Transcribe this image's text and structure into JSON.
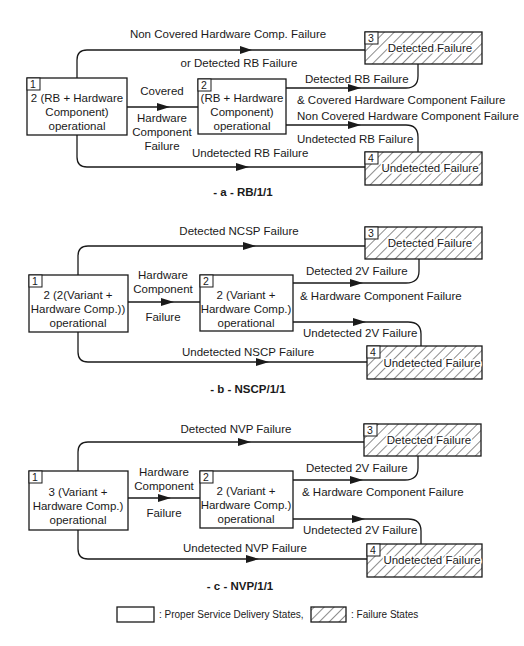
{
  "diagrams": [
    {
      "caption": "- a -  RB/1/1",
      "states": {
        "s1": {
          "num": "1",
          "lines": [
            "2 (RB + Hardware",
            "Component)",
            "operational"
          ]
        },
        "s2": {
          "num": "2",
          "lines": [
            "(RB + Hardware",
            "Component)",
            "operational"
          ]
        },
        "s3": {
          "num": "3",
          "label": "Detected Failure"
        },
        "s4": {
          "num": "4",
          "label": "Undetected Failure"
        }
      },
      "transitions": {
        "s1_s3": [
          "Non Covered Hardware Comp. Failure",
          "or Detected RB Failure"
        ],
        "s1_s2": [
          "Covered",
          "Hardware",
          "Component",
          "Failure"
        ],
        "s2_s3": [
          "Detected RB Failure",
          "& Covered Hardware Component Failure"
        ],
        "s2_s4": [
          "Non Covered Hardware Component Failure",
          "Undetected RB Failure"
        ],
        "s1_s4": [
          "Undetected RB Failure"
        ]
      }
    },
    {
      "caption": "- b -  NSCP/1/1",
      "states": {
        "s1": {
          "num": "1",
          "lines": [
            "2 (2(Variant +",
            "Hardware Comp.))",
            "operational"
          ]
        },
        "s2": {
          "num": "2",
          "lines": [
            "2 (Variant +",
            "Hardware Comp.)",
            "operational"
          ]
        },
        "s3": {
          "num": "3",
          "label": "Detected Failure"
        },
        "s4": {
          "num": "4",
          "label": "Undetected Failure"
        }
      },
      "transitions": {
        "s1_s3": [
          "Detected NCSP Failure"
        ],
        "s1_s2": [
          "Hardware",
          "Component",
          "Failure"
        ],
        "s2_s3": [
          "Detected 2V Failure",
          "& Hardware Component Failure"
        ],
        "s2_s4": [
          "Undetected 2V Failure"
        ],
        "s1_s4": [
          "Undetected NSCP Failure"
        ]
      }
    },
    {
      "caption": "- c -  NVP/1/1",
      "states": {
        "s1": {
          "num": "1",
          "lines": [
            "3 (Variant +",
            "Hardware Comp.)",
            "operational"
          ]
        },
        "s2": {
          "num": "2",
          "lines": [
            "2 (Variant +",
            "Hardware Comp.)",
            "operational"
          ]
        },
        "s3": {
          "num": "3",
          "label": "Detected Failure"
        },
        "s4": {
          "num": "4",
          "label": "Undetected Failure"
        }
      },
      "transitions": {
        "s1_s3": [
          "Detected NVP Failure"
        ],
        "s1_s2": [
          "Hardware",
          "Component",
          "Failure"
        ],
        "s2_s3": [
          "Detected 2V Failure",
          "& Hardware Component Failure"
        ],
        "s2_s4": [
          "Undetected 2V Failure"
        ],
        "s1_s4": [
          "Undetected NVP Failure"
        ]
      }
    }
  ],
  "legend": {
    "proper": ": Proper Service Delivery States,",
    "failure": ": Failure States"
  }
}
